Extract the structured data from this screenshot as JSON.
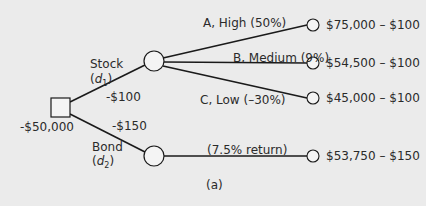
{
  "diagram": {
    "type": "decision-tree",
    "caption": "(a)",
    "colors": {
      "background": "#ebebeb",
      "line": "#1a1a1a",
      "node_fill": "#f4f4f4"
    },
    "root": {
      "label": "-$50,000",
      "shape": "square"
    },
    "decisions": [
      {
        "name": "Stock",
        "var": "d",
        "sub": "1",
        "cost": "-$100",
        "outcomes": [
          {
            "label": "A, High (50%)",
            "payoff": "$75,000 – $100"
          },
          {
            "label": "B, Medium (9%)",
            "payoff": "$54,500 – $100"
          },
          {
            "label": "C, Low (–30%)",
            "payoff": "$45,000 – $100"
          }
        ]
      },
      {
        "name": "Bond",
        "var": "d",
        "sub": "2",
        "cost": "-$150",
        "outcomes": [
          {
            "label": "(7.5% return)",
            "payoff": "$53,750 – $150"
          }
        ]
      }
    ]
  }
}
